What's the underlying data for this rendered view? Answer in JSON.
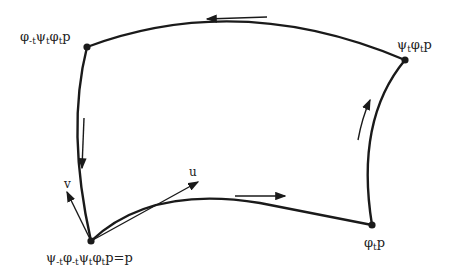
{
  "diagram": {
    "type": "commutator-loop",
    "colors": {
      "stroke": "#1a1a1a",
      "background": "#ffffff"
    },
    "vertices": {
      "top_left": {
        "label": "φ₋ₜψₜφₜp",
        "parts": [
          "φ",
          "-t",
          "ψ",
          "t",
          "φ",
          "t",
          "p"
        ]
      },
      "top_right": {
        "label": "ψₜφₜp",
        "parts": [
          "ψ",
          "t",
          "φ",
          "t",
          "p"
        ]
      },
      "bottom_right": {
        "label": "φₜp",
        "parts": [
          "φ",
          "t",
          "p"
        ]
      },
      "bottom_left": {
        "label": "ψ₋ₜφ₋ₜψₜφₜp=p",
        "parts": [
          "ψ",
          "-t",
          "φ",
          "-t",
          "ψ",
          "t",
          "φ",
          "t",
          "p=p"
        ]
      }
    },
    "vectors": {
      "u": {
        "label": "u"
      },
      "v": {
        "label": "v"
      }
    },
    "direction_arrows": [
      "bottom: rightward",
      "right: upward",
      "top: leftward",
      "left: downward"
    ]
  }
}
